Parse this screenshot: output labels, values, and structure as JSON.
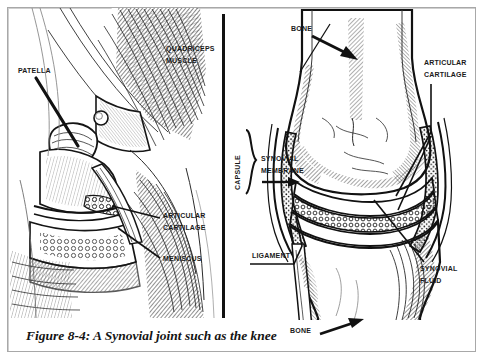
{
  "figure": {
    "caption": "Figure 8-4:  A Synovial joint such as the knee",
    "background_color": "#ffffff",
    "frame_color": "#a8a8a8",
    "ink_color": "#1a1a1a"
  },
  "left_panel": {
    "description": "Sagittal cross-section engraving of the human knee",
    "labels": [
      {
        "id": "patella",
        "text": "Patella",
        "x": 18,
        "y": 64
      },
      {
        "id": "quadriceps-muscle",
        "text": "Quadriceps Muscle",
        "x": 166,
        "y": 42
      },
      {
        "id": "articular-cartilage-left",
        "text": "Articular Cartilage",
        "x": 163,
        "y": 209
      },
      {
        "id": "meniscus",
        "text": "Meniscus",
        "x": 163,
        "y": 252
      }
    ]
  },
  "right_panel": {
    "description": "Schematic diagram of a synovial joint showing capsule, membrane and cavity",
    "labels": [
      {
        "id": "bone-top",
        "text": "Bone",
        "x": 291,
        "y": 22
      },
      {
        "id": "articular-cartilage-right",
        "text": "Articular Cartilage",
        "x": 424,
        "y": 56
      },
      {
        "id": "capsule",
        "text": "Capsule",
        "x": 231,
        "y": 132
      },
      {
        "id": "synovial-membrane",
        "text": "Synovial Membrane",
        "x": 261,
        "y": 152
      },
      {
        "id": "ligament",
        "text": "Ligament",
        "x": 252,
        "y": 249
      },
      {
        "id": "synovial-fluid",
        "text": "Synovial Fluid",
        "x": 420,
        "y": 262
      },
      {
        "id": "bone-bottom",
        "text": "Bone",
        "x": 290,
        "y": 324
      }
    ]
  }
}
